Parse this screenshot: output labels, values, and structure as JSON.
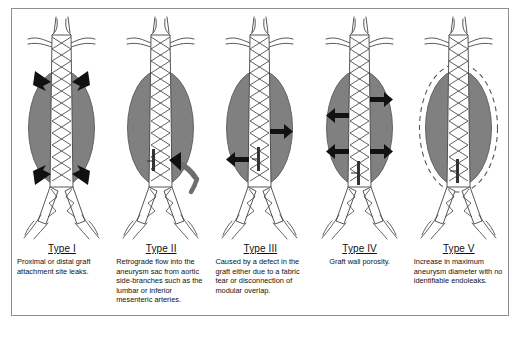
{
  "figure": {
    "colors": {
      "frame_border": "#8f8f8f",
      "background": "#ffffff",
      "aneurysm_sac": "#808080",
      "vessel_outline": "#444444",
      "arrow_black": "#111111",
      "arrow_gray": "#6e6e6e",
      "text": "#111111"
    },
    "panels": [
      {
        "id": "type-1",
        "title": "Type I",
        "body": "Proximal or distal graft attachment site leaks.",
        "arrows": "four black arrows angled inward at the proximal and distal graft attachment sites",
        "sac_outline": "solid"
      },
      {
        "id": "type-2",
        "title": "Type II",
        "body": "Retrograde flow into the aneurysm sac from aortic side-branches such as the lumbar or inferior mesenteric arteries.",
        "arrows": "one curved gray arrow entering the sac from an aortic side-branch on the right",
        "sac_outline": "solid"
      },
      {
        "id": "type-3",
        "title": "Type III",
        "body": "Caused by a defect in the graft either due to a fabric tear or disconnection of modular overlap.",
        "arrows": "two horizontal black arrows, upper pointing right and lower pointing left",
        "sac_outline": "solid"
      },
      {
        "id": "type-4",
        "title": "Type IV",
        "body": "Graft wall porosity.",
        "arrows": "four black arrows radiating outward through the graft wall",
        "sac_outline": "solid"
      },
      {
        "id": "type-5",
        "title": "Type V",
        "body": "Increase in maximum aneurysm diameter with no identifiable endoleaks.",
        "arrows": "none",
        "sac_outline": "dashed expansion outline"
      }
    ]
  }
}
